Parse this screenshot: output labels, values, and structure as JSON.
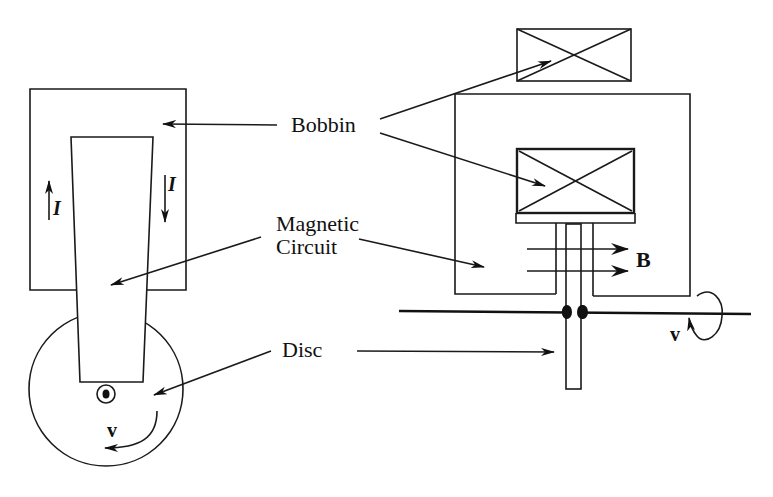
{
  "diagram": {
    "labels": {
      "bobbin": "Bobbin",
      "magnetic_circuit_line1": "Magnetic",
      "magnetic_circuit_line2": "Circuit",
      "disc": "Disc"
    },
    "symbols": {
      "current_left": "I",
      "current_right": "I",
      "field": "B",
      "velocity_left": "v",
      "velocity_right": "v"
    },
    "colors": {
      "stroke": "#1a1a1a",
      "background": "#ffffff"
    }
  }
}
